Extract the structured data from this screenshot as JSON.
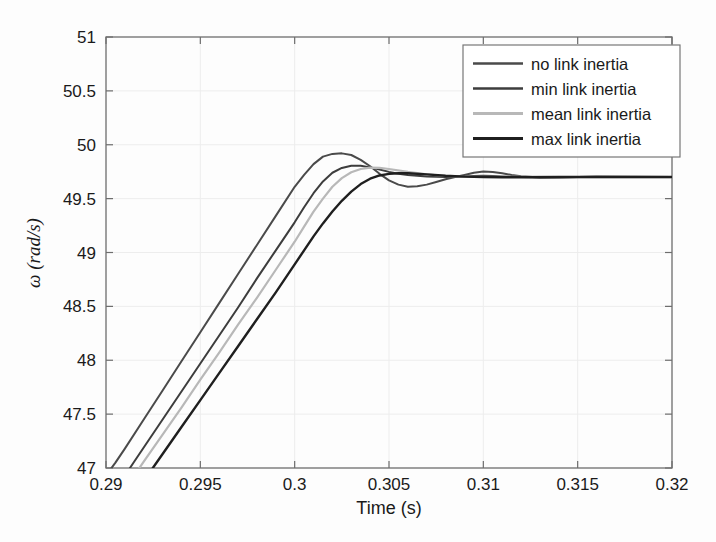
{
  "chart_data": {
    "type": "line",
    "title": "",
    "xlabel": "Time (s)",
    "ylabel": "ω (rad/s)",
    "xlim": [
      0.29,
      0.32
    ],
    "ylim": [
      47,
      51
    ],
    "xticks": [
      "0.29",
      "0.295",
      "0.3",
      "0.305",
      "0.31",
      "0.315",
      "0.32"
    ],
    "xtick_values": [
      0.29,
      0.295,
      0.3,
      0.305,
      0.31,
      0.315,
      0.32
    ],
    "yticks": [
      "47",
      "47.5",
      "48",
      "48.5",
      "49",
      "49.5",
      "50",
      "50.5",
      "51"
    ],
    "ytick_values": [
      47,
      47.5,
      48,
      48.5,
      49,
      49.5,
      50,
      50.5,
      51
    ],
    "grid": true,
    "legend_position": "top-right",
    "series": [
      {
        "name": "no link inertia",
        "color": "#4a4a4a",
        "width": 2.0,
        "x": [
          0.29,
          0.2905,
          0.291,
          0.292,
          0.293,
          0.294,
          0.295,
          0.296,
          0.297,
          0.298,
          0.299,
          0.3,
          0.3005,
          0.301,
          0.3015,
          0.302,
          0.3025,
          0.303,
          0.3035,
          0.304,
          0.3045,
          0.305,
          0.3055,
          0.306,
          0.3065,
          0.307,
          0.3075,
          0.308,
          0.3085,
          0.309,
          0.3095,
          0.31,
          0.3105,
          0.311,
          0.3115,
          0.312,
          0.313,
          0.314,
          0.315,
          0.316,
          0.318,
          0.32
        ],
        "y": [
          46.93,
          47.05,
          47.18,
          47.45,
          47.72,
          47.99,
          48.26,
          48.53,
          48.8,
          49.07,
          49.34,
          49.61,
          49.72,
          49.82,
          49.89,
          49.915,
          49.92,
          49.905,
          49.86,
          49.8,
          49.73,
          49.67,
          49.63,
          49.61,
          49.615,
          49.63,
          49.655,
          49.68,
          49.7,
          49.72,
          49.74,
          49.752,
          49.748,
          49.735,
          49.72,
          49.708,
          49.697,
          49.695,
          49.7,
          49.703,
          49.702,
          49.7
        ]
      },
      {
        "name": "min link inertia",
        "color": "#3d3d3d",
        "width": 2.0,
        "x": [
          0.291,
          0.2915,
          0.292,
          0.293,
          0.294,
          0.295,
          0.296,
          0.297,
          0.298,
          0.299,
          0.3,
          0.3005,
          0.301,
          0.3015,
          0.302,
          0.3025,
          0.303,
          0.3035,
          0.304,
          0.3045,
          0.305,
          0.3055,
          0.306,
          0.307,
          0.308,
          0.309,
          0.3095,
          0.31,
          0.3105,
          0.311,
          0.312,
          0.313,
          0.314,
          0.315,
          0.316,
          0.318,
          0.32
        ],
        "y": [
          46.93,
          47.06,
          47.19,
          47.45,
          47.71,
          47.97,
          48.23,
          48.49,
          48.76,
          49.02,
          49.28,
          49.42,
          49.55,
          49.66,
          49.74,
          49.785,
          49.805,
          49.805,
          49.79,
          49.77,
          49.748,
          49.73,
          49.72,
          49.705,
          49.7,
          49.705,
          49.71,
          49.712,
          49.71,
          49.706,
          49.7,
          49.697,
          49.698,
          49.7,
          49.702,
          49.701,
          49.7
        ]
      },
      {
        "name": "mean link inertia",
        "color": "#b8b8b8",
        "width": 2.2,
        "x": [
          0.2915,
          0.292,
          0.293,
          0.294,
          0.295,
          0.296,
          0.297,
          0.298,
          0.299,
          0.3,
          0.3005,
          0.301,
          0.3015,
          0.302,
          0.3025,
          0.303,
          0.3035,
          0.304,
          0.3045,
          0.305,
          0.306,
          0.307,
          0.308,
          0.309,
          0.31,
          0.311,
          0.312,
          0.314,
          0.316,
          0.318,
          0.32
        ],
        "y": [
          46.93,
          47.06,
          47.31,
          47.56,
          47.82,
          48.07,
          48.33,
          48.58,
          48.84,
          49.1,
          49.24,
          49.38,
          49.5,
          49.61,
          49.69,
          49.745,
          49.775,
          49.787,
          49.785,
          49.775,
          49.748,
          49.725,
          49.71,
          49.703,
          49.702,
          49.702,
          49.701,
          49.7,
          49.7,
          49.7,
          49.7
        ]
      },
      {
        "name": "max link inertia",
        "color": "#1f1f1f",
        "width": 2.4,
        "x": [
          0.2922,
          0.293,
          0.294,
          0.295,
          0.296,
          0.297,
          0.298,
          0.299,
          0.3,
          0.3005,
          0.301,
          0.3015,
          0.302,
          0.3025,
          0.303,
          0.3035,
          0.304,
          0.3045,
          0.305,
          0.3055,
          0.306,
          0.307,
          0.308,
          0.309,
          0.31,
          0.311,
          0.312,
          0.314,
          0.316,
          0.318,
          0.32
        ],
        "y": [
          46.93,
          47.13,
          47.38,
          47.63,
          47.88,
          48.13,
          48.38,
          48.63,
          48.89,
          49.02,
          49.15,
          49.27,
          49.38,
          49.48,
          49.565,
          49.635,
          49.685,
          49.715,
          49.73,
          49.735,
          49.735,
          49.725,
          49.712,
          49.704,
          49.7,
          49.699,
          49.699,
          49.7,
          49.7,
          49.7,
          49.7
        ]
      }
    ]
  },
  "legend": {
    "items": [
      {
        "label": "no link inertia"
      },
      {
        "label": "min link inertia"
      },
      {
        "label": "mean link inertia"
      },
      {
        "label": "max link inertia"
      }
    ]
  },
  "axes": {
    "x_title": "Time (s)",
    "y_title": "ω (rad/s)"
  }
}
